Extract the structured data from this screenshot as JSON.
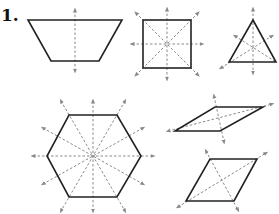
{
  "problem": {
    "number_label": "1."
  },
  "colors": {
    "outline": "#222222",
    "axis": "#8a8a8a",
    "background": "#ffffff"
  },
  "figures": [
    {
      "name": "isosceles-trapezoid",
      "lines_of_symmetry": 1
    },
    {
      "name": "square",
      "lines_of_symmetry": 4
    },
    {
      "name": "equilateral-triangle",
      "lines_of_symmetry": 3
    },
    {
      "name": "regular-hexagon",
      "lines_of_symmetry": 6
    },
    {
      "name": "rhombus-flat",
      "lines_of_symmetry": 2
    },
    {
      "name": "rhombus-tilted",
      "lines_of_symmetry": 2
    }
  ]
}
